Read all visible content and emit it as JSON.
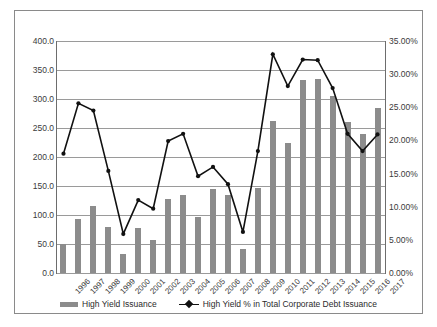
{
  "chart_data": {
    "type": "bar",
    "title": "",
    "xlabel": "",
    "ylabel": "",
    "grid": true,
    "legend_position": "bottom",
    "categories": [
      "1996",
      "1997",
      "1998",
      "1999",
      "2000",
      "2001",
      "2002",
      "2003",
      "2004",
      "2005",
      "2006",
      "2007",
      "2008",
      "2009",
      "2010",
      "2011",
      "2012",
      "2013",
      "2014",
      "2015",
      "2016",
      "2017"
    ],
    "axes": {
      "left": {
        "label": "",
        "ylim": [
          0,
          400
        ],
        "ticks": [
          "0.0",
          "50.0",
          "100.0",
          "150.0",
          "200.0",
          "250.0",
          "300.0",
          "350.0",
          "400.0"
        ],
        "tick_values": [
          0,
          50,
          100,
          150,
          200,
          250,
          300,
          350,
          400
        ]
      },
      "right": {
        "label": "",
        "ylim": [
          0,
          35
        ],
        "ticks": [
          "0.00%",
          "5.00%",
          "10.00%",
          "15.00%",
          "20.00%",
          "25.00%",
          "30.00%",
          "35.00%"
        ],
        "tick_values": [
          0,
          5,
          10,
          15,
          20,
          25,
          30,
          35
        ]
      }
    },
    "series": [
      {
        "name": "High Yield Issuance",
        "type": "bar",
        "axis": "left",
        "color": "#8c8c8c",
        "values": [
          50,
          93,
          115,
          79,
          32,
          77,
          57,
          128,
          135,
          96,
          145,
          135,
          42,
          147,
          262,
          224,
          332,
          335,
          305,
          261,
          239,
          284
        ]
      },
      {
        "name": "High Yield % in Total Corporate Debt Issuance",
        "type": "line",
        "axis": "right",
        "color": "#111111",
        "values": [
          18.0,
          25.6,
          24.5,
          15.4,
          5.9,
          11.0,
          9.7,
          19.9,
          21.0,
          14.6,
          16.0,
          13.4,
          6.2,
          18.4,
          33.0,
          28.2,
          32.2,
          32.1,
          27.9,
          21.0,
          18.4,
          20.9
        ]
      }
    ]
  },
  "legend": {
    "items": [
      {
        "label": "High Yield Issuance",
        "marker": "bar-swatch-icon"
      },
      {
        "label": "High Yield % in Total Corporate Debt Issuance",
        "marker": "line-marker-icon"
      }
    ]
  }
}
